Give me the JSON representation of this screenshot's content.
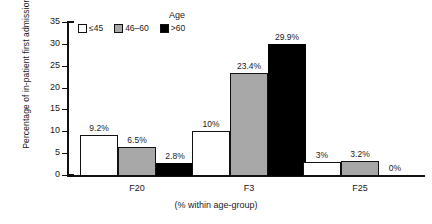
{
  "chart_data": {
    "type": "bar",
    "title": "",
    "xlabel": "(% within age-group)",
    "ylabel": "Percentage of in-patient first admissions",
    "ylim": [
      0,
      35
    ],
    "yticks": [
      "0",
      "5",
      "10",
      "15",
      "20",
      "25",
      "30",
      "35"
    ],
    "grid": false,
    "legend_title": "Age",
    "legend_position": "top-center",
    "categories": [
      "F20",
      "F3",
      "F25"
    ],
    "series": [
      {
        "name": "≤45",
        "color": "#ffffff",
        "values": [
          9.2,
          10,
          3
        ],
        "labels": [
          "9.2%",
          "10%",
          "3%"
        ]
      },
      {
        "name": "46–60",
        "color": "#a8a8a8",
        "values": [
          6.5,
          23.4,
          3.2
        ],
        "labels": [
          "6.5%",
          "23.4%",
          "3.2%"
        ]
      },
      {
        "name": ">60",
        "color": "#000000",
        "values": [
          2.8,
          29.9,
          0
        ],
        "labels": [
          "2.8%",
          "29.9%",
          "0%"
        ]
      }
    ]
  }
}
